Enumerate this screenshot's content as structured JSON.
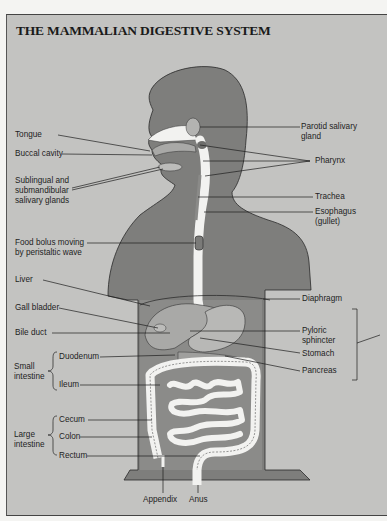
{
  "title": "THE MAMMALIAN DIGESTIVE SYSTEM",
  "colors": {
    "panel_background": "#c3c3c1",
    "body_silhouette": "#7e7e7c",
    "organ_light": "#a9a9a7",
    "tract_white": "#f2f2f0",
    "label_text": "#1e1e1e"
  },
  "labels": {
    "tongue": "Tongue",
    "buccal_cavity": "Buccal cavity",
    "sublingual_1": "Sublingual and",
    "sublingual_2": "submandibular",
    "sublingual_3": "salivary glands",
    "food_bolus_1": "Food bolus moving",
    "food_bolus_2": "by peristaltic wave",
    "parotid_1": "Parotid salivary",
    "parotid_2": "gland",
    "pharynx": "Pharynx",
    "trachea": "Trachea",
    "esophagus_1": "Esophagus",
    "esophagus_2": "(gullet)",
    "liver": "Liver",
    "gall_bladder": "Gall bladder",
    "bile_duct": "Bile duct",
    "diaphragm": "Diaphragm",
    "pyloric_1": "Pyloric",
    "pyloric_2": "sphincter",
    "stomach": "Stomach",
    "pancreas": "Pancreas",
    "small_intestine_1": "Small",
    "small_intestine_2": "intestine",
    "duodenum": "Duodenum",
    "ileum": "Ileum",
    "large_intestine_1": "Large",
    "large_intestine_2": "intestine",
    "cecum": "Cecum",
    "colon": "Colon",
    "rectum": "Rectum",
    "appendix": "Appendix",
    "anus": "Anus"
  }
}
